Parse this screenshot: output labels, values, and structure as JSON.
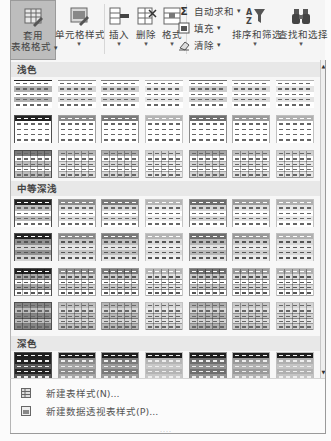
{
  "ribbon": {
    "format_as_table": {
      "label_line1": "套用",
      "label_line2": "表格格式",
      "icon": "table-style-icon",
      "dropdown": "▾"
    },
    "cell_styles": {
      "label": "单元格样式",
      "icon": "cell-style-icon",
      "dropdown": "▾"
    },
    "insert": {
      "label": "插入",
      "icon": "insert-cells-icon",
      "dropdown": "▾"
    },
    "delete": {
      "label": "删除",
      "icon": "delete-cells-icon",
      "dropdown": "▾"
    },
    "format": {
      "label": "格式",
      "icon": "format-cells-icon",
      "dropdown": "▾"
    },
    "autosum": {
      "label": "自动求和",
      "icon": "sigma-icon",
      "glyph": "Σ",
      "dropdown": "▾"
    },
    "fill": {
      "label": "填充",
      "icon": "fill-icon",
      "dropdown": "▾"
    },
    "clear": {
      "label": "清除",
      "icon": "eraser-icon",
      "dropdown": "▾"
    },
    "sort_filter": {
      "label": "排序和筛选",
      "icon": "sort-filter-icon",
      "dropdown": "▾"
    },
    "find_select": {
      "label": "查找和选择",
      "icon": "binoculars-icon",
      "dropdown": "▾"
    }
  },
  "gallery": {
    "sections": [
      {
        "label": "浅色"
      },
      {
        "label": "中等深浅"
      },
      {
        "label": "深色"
      }
    ],
    "accent_colors": [
      "#222222",
      "#8a8a8a",
      "#7a7a7a",
      "#b5b5b5",
      "#6e6e6e",
      "#9a9a9a",
      "#b0b0b0"
    ]
  },
  "scrollbar": {
    "up": "▲",
    "down": "▼"
  },
  "menu": {
    "new_table_style": "新建表样式(N)...",
    "new_pivot_style": "新建数据透视表样式(P)..."
  },
  "grip": "::::"
}
